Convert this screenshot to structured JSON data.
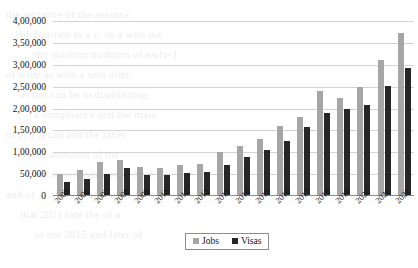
{
  "chart_data": {
    "type": "bar",
    "title": "",
    "subtitle": "",
    "xlabel": "",
    "ylabel": "",
    "ylim": [
      0,
      400000
    ],
    "ytick_step": 50000,
    "grid": true,
    "legend_position": "bottom",
    "number_format": "indian",
    "categories": [
      "2005",
      "2006",
      "2007",
      "2008",
      "2009",
      "2010",
      "2011",
      "2012",
      "2013",
      "2014",
      "2015",
      "2016",
      "2017",
      "2018",
      "2019",
      "2020",
      "2021",
      "2022"
    ],
    "ytick_labels": [
      "4,00,000",
      "3,50,000",
      "3,00,000",
      "2,50,000",
      "2,00,000",
      "1,50,000",
      "1,00,000",
      "50,000",
      "0"
    ],
    "ytick_values": [
      400000,
      350000,
      300000,
      250000,
      200000,
      150000,
      100000,
      50000,
      0
    ],
    "series": [
      {
        "name": "Jobs",
        "color": "#a6a6a6",
        "values": [
          50000,
          60000,
          77000,
          82000,
          66000,
          65000,
          70000,
          74000,
          100000,
          115000,
          130000,
          160000,
          180000,
          240000,
          225000,
          250000,
          310000,
          372000
        ]
      },
      {
        "name": "Visas",
        "color": "#262626",
        "values": [
          33000,
          38000,
          51000,
          63000,
          48000,
          48000,
          52000,
          55000,
          72000,
          90000,
          105000,
          125000,
          157000,
          190000,
          200000,
          207000,
          252000,
          292000
        ]
      }
    ]
  },
  "legend": {
    "items": [
      {
        "label": "Jobs",
        "color": "#a6a6a6"
      },
      {
        "label": "Visas",
        "color": "#262626"
      }
    ]
  },
  "background_text": [
    "the tentative of the reasons",
    "of 2nd-rate to a c. of a with the",
    "thy stadium tradition of early-1",
    "of wide as with a sent after",
    "as not can be to distributing",
    "a compliance and the main",
    "or 2. a it can and the latter",
    "of the attention of the",
    "but to seconday even later",
    "and of 1, a 2nd of the main",
    "that 2011 rate the of a",
    "as not 2015 and later of"
  ]
}
